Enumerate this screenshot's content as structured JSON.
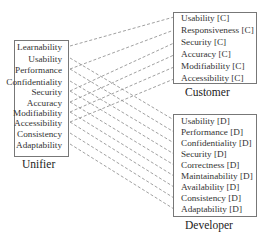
{
  "unifier": {
    "caption": "Unifier",
    "items": [
      "Learnability",
      "Usability",
      "Performance",
      "Confidentiality",
      "Security",
      "Accuracy",
      "Modifiability",
      "Accessibility",
      "Consistency",
      "Adaptability"
    ]
  },
  "customer": {
    "caption": "Customer",
    "items": [
      "Usability [C]",
      "Responsiveness [C]",
      "Security [C]",
      "Accuracy [C]",
      "Modifiability [C]",
      "Accessibility [C]"
    ]
  },
  "developer": {
    "caption": "Developer",
    "items": [
      "Usability [D]",
      "Performance [D]",
      "Confidentiality [D]",
      "Security [D]",
      "Correctness [D]",
      "Maintainability [D]",
      "Availability [D]",
      "Consistency [D]",
      "Adaptability [D]"
    ]
  },
  "links": [
    {
      "from": "Learnability",
      "to": "Usability [C]"
    },
    {
      "from": "Usability",
      "to": "Usability [D]"
    },
    {
      "from": "Performance",
      "to": "Responsiveness [C]"
    },
    {
      "from": "Performance",
      "to": "Performance [D]"
    },
    {
      "from": "Confidentiality",
      "to": "Confidentiality [D]"
    },
    {
      "from": "Security",
      "to": "Security [C]"
    },
    {
      "from": "Security",
      "to": "Security [D]"
    },
    {
      "from": "Accuracy",
      "to": "Accuracy [C]"
    },
    {
      "from": "Accuracy",
      "to": "Correctness [D]"
    },
    {
      "from": "Modifiability",
      "to": "Modifiability [C]"
    },
    {
      "from": "Modifiability",
      "to": "Maintainability [D]"
    },
    {
      "from": "Accessibility",
      "to": "Accessibility [C]"
    },
    {
      "from": "Accessibility",
      "to": "Availability [D]"
    },
    {
      "from": "Consistency",
      "to": "Consistency [D]"
    },
    {
      "from": "Adaptability",
      "to": "Adaptability [D]"
    }
  ]
}
